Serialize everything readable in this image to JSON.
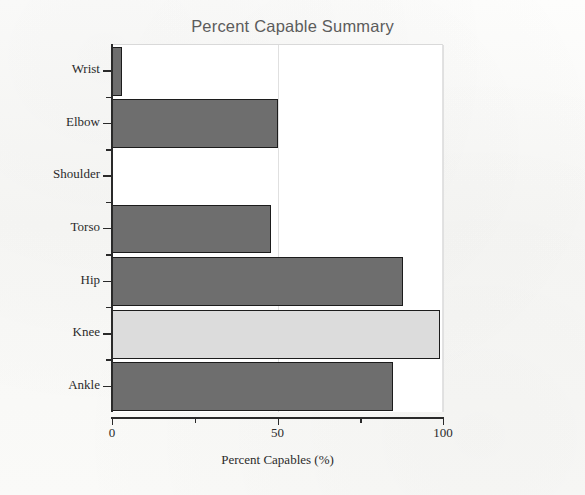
{
  "chart_data": {
    "type": "bar",
    "orientation": "horizontal",
    "title": "Percent Capable Summary",
    "xlabel": "Percent Capables (%)",
    "ylabel": "",
    "categories": [
      "Wrist",
      "Elbow",
      "Shoulder",
      "Torso",
      "Hip",
      "Knee",
      "Ankle"
    ],
    "values": [
      3,
      50,
      0,
      48,
      88,
      99,
      85
    ],
    "xlim": [
      0,
      100
    ],
    "xticks": [
      0,
      50,
      100
    ],
    "xtick_labels": [
      "0",
      "50",
      "100"
    ],
    "grid": "vertical-only",
    "legend": "none",
    "bar_colors": [
      "#6e6e6e",
      "#6e6e6e",
      "#6e6e6e",
      "#6e6e6e",
      "#6e6e6e",
      "#dcdcdc",
      "#6e6e6e"
    ],
    "highlighted_category": "Knee",
    "series": [
      {
        "name": "Percent Capables (%)",
        "values": [
          3,
          50,
          0,
          48,
          88,
          99,
          85
        ]
      }
    ]
  },
  "colors": {
    "bar_fill": "#6e6e6e",
    "bar_highlight": "#dcdcdc",
    "bar_outline": "#1c1c1c",
    "axis": "#2a2a2a",
    "grid": "#e0e0e0",
    "title_text": "#5c5c5c",
    "page_background": "#fbfbfa",
    "plot_background": "#ffffff"
  }
}
